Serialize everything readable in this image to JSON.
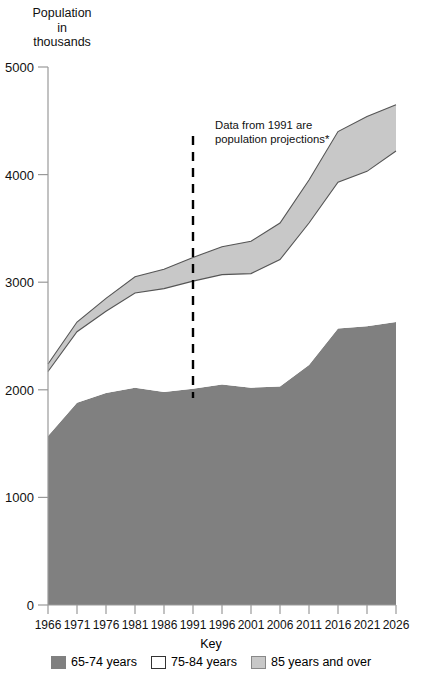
{
  "chart_data": {
    "type": "area",
    "title": "Population in thousands",
    "title_lines": [
      "Population",
      "in",
      "thousands"
    ],
    "xlabel": "",
    "ylabel": "Population in thousands",
    "stacked": true,
    "grid": false,
    "legend_position": "bottom",
    "legend_title": "Key",
    "xlim": [
      1966,
      2026
    ],
    "ylim": [
      0,
      5000
    ],
    "ytick_labels": [
      "0",
      "1000",
      "2000",
      "3000",
      "4000",
      "5000"
    ],
    "yticks": [
      0,
      1000,
      2000,
      3000,
      4000,
      5000
    ],
    "categories": [
      1966,
      1971,
      1976,
      1981,
      1986,
      1991,
      1996,
      2001,
      2006,
      2011,
      2016,
      2021,
      2026
    ],
    "xtick_labels": [
      "1966",
      "1971",
      "1976",
      "1981",
      "1986",
      "1991",
      "1996",
      "2001",
      "2006",
      "2011",
      "2016",
      "2021",
      "2026"
    ],
    "series": [
      {
        "name": "65-74 years",
        "color": "#808080",
        "values": [
          1570,
          1880,
          1970,
          2020,
          1980,
          2010,
          2050,
          2020,
          2030,
          2230,
          2570,
          2590,
          2630
        ]
      },
      {
        "name": "75-84 years",
        "color": "#ffffff",
        "values": [
          600,
          660,
          760,
          880,
          960,
          1000,
          1020,
          1060,
          1180,
          1320,
          1360,
          1440,
          1590
        ]
      },
      {
        "name": "85 years and over",
        "color": "#c8c8c8",
        "values": [
          70,
          90,
          120,
          150,
          180,
          220,
          260,
          300,
          340,
          400,
          470,
          510,
          430
        ]
      }
    ],
    "cumulative_totals": [
      2240,
      2630,
      2850,
      2920,
      3120,
      3230,
      3330,
      3380,
      3550,
      3950,
      4400,
      4540,
      4650
    ],
    "cumulative_mid": [
      2170,
      2540,
      2730,
      2900,
      2940,
      3010,
      3070,
      3080,
      3210,
      3550,
      3930,
      4030,
      4220
    ],
    "annotation": {
      "line1": "Data from 1991 are",
      "line2": "population projections*",
      "marker_year": 1991
    },
    "colors": {
      "dark_gray": "#808080",
      "light_gray": "#c8c8c8",
      "white": "#ffffff",
      "outline": "#555555",
      "axis": "#999999",
      "text": "#111111"
    }
  },
  "legend": {
    "title": "Key",
    "items": [
      {
        "label": "65-74 years",
        "color": "#808080",
        "border": "#808080"
      },
      {
        "label": "75-84 years",
        "color": "#ffffff",
        "border": "#333333"
      },
      {
        "label": "85 years and over",
        "color": "#c8c8c8",
        "border": "#888888"
      }
    ]
  }
}
